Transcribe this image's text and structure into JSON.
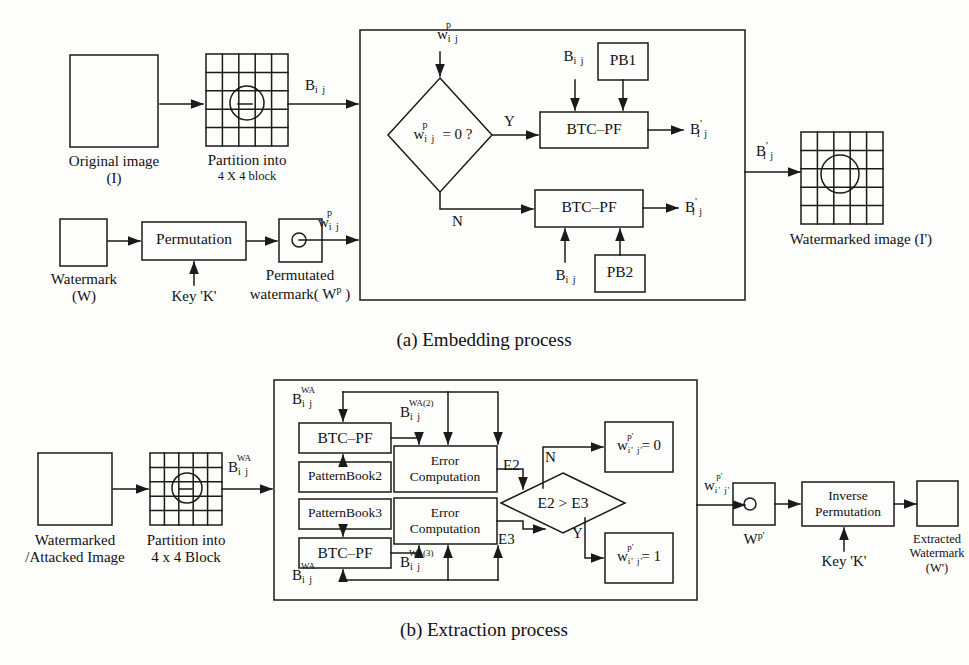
{
  "figure": {
    "caption_a": "(a) Embedding process",
    "caption_b": "(b) Extraction process",
    "stroke_color": "#1a1a1a",
    "background_color": "#fdfdfc"
  },
  "embedding": {
    "original_image": {
      "label_line1": "Original image",
      "label_line2": "(I)"
    },
    "partition": {
      "label_line1": "Partition into",
      "label_line2": "4 X 4 block"
    },
    "block_signal": "B",
    "block_signal_sub": "i j",
    "watermark": {
      "label_line1": "Watermark",
      "label_line2": "(W)"
    },
    "permutation_box": "Permutation",
    "key_label": "Key 'K'",
    "permuted_watermark": {
      "label_line1": "Permutated",
      "label_line2": "watermark( W",
      "label_sup": "p",
      "label_close": " )"
    },
    "wp_signal": "w",
    "wp_sub": "i j",
    "wp_sup": "p",
    "decision": {
      "text_main": "w",
      "text_sub": "i j",
      "text_sup": "p",
      "text_tail": "= 0 ?"
    },
    "branch_yes": "Y",
    "branch_no": "N",
    "btc_pf_top": "BTC–PF",
    "btc_pf_bottom": "BTC–PF",
    "pattern_book_1": "PB1",
    "pattern_book_2": "PB2",
    "b_in_top": "B",
    "b_in_top_sub": "i j",
    "b_in_bottom": "B",
    "b_in_bottom_sub": "i j",
    "b_out_top": "B",
    "b_out_top_sub": "i j",
    "b_out_top_prime": "'",
    "b_out_bottom": "B",
    "b_out_bottom_sub": "i j",
    "b_out_bottom_prime": "'",
    "b_final": "B",
    "b_final_sub": "i j",
    "b_final_prime": "'",
    "watermarked_image_label": "Watermarked image (I')"
  },
  "extraction": {
    "input_image": {
      "label_line1": "Watermarked",
      "label_line2": "/Attacked Image"
    },
    "partition": {
      "label_line1": "Partition into",
      "label_line2": "4 x 4 Block"
    },
    "b_wa": "B",
    "b_wa_sub": "i j",
    "b_wa_sup": "WA",
    "b_wa_top_inner": "B",
    "b_wa_top_inner_sub": "i j",
    "b_wa_top_inner_sup": "WA",
    "b_wa_bottom_inner": "B",
    "b_wa_bottom_inner_sub": "i j",
    "b_wa_bottom_inner_sup": "WA",
    "b_wa2": "B",
    "b_wa2_sub": "i j",
    "b_wa2_sup": "WA(2)",
    "b_wa3": "B",
    "b_wa3_sub": "i j",
    "b_wa3_sup": "WA(3)",
    "btc_pf_top": "BTC–PF",
    "btc_pf_bottom": "BTC–PF",
    "pattern_book_2": "PatternBook2",
    "pattern_book_3": "PatternBook3",
    "error_computation_top_l1": "Error",
    "error_computation_top_l2": "Computation",
    "error_computation_bottom_l1": "Error",
    "error_computation_bottom_l2": "Computation",
    "e2_label": "E2",
    "e3_label": "E3",
    "decision_text": "E2  >   E3",
    "branch_no": "N",
    "branch_yes": "Y",
    "result_zero": {
      "text_main": "w",
      "text_sub": "i' j'",
      "text_sup": "p'",
      "text_tail": "= 0"
    },
    "result_one": {
      "text_main": "w",
      "text_sub": "i' j'",
      "text_sup": "p'",
      "text_tail": "= 1"
    },
    "w_out": "w",
    "w_out_sub": "i' j'",
    "w_out_sup": "p'",
    "wp_prime": "W",
    "wp_prime_sup": "p'",
    "inverse_permutation_l1": "Inverse",
    "inverse_permutation_l2": "Permutation",
    "key_label": "Key 'K'",
    "extracted_watermark": {
      "label_line1": "Extracted",
      "label_line2": "Watermark",
      "label_line3": "(W')"
    }
  }
}
